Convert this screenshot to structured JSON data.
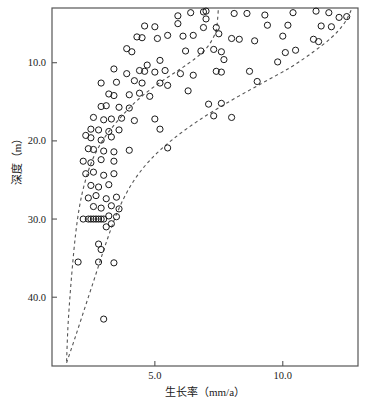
{
  "chart_data": {
    "type": "scatter",
    "title": "",
    "xlabel": "生长率（mm/a）",
    "ylabel": "深度（m）",
    "xlim": [
      0.98,
      12.94
    ],
    "ylim": [
      48.8,
      3.0
    ],
    "y_inverted": true,
    "grid": false,
    "legend": null,
    "xticks": [
      5.0,
      10.0
    ],
    "xtick_labels": [
      "5.0",
      "10.0"
    ],
    "yticks": [
      10.0,
      20.0,
      30.0,
      40.0
    ],
    "ytick_labels": [
      "10.0",
      "20.0",
      "30.0",
      "40.0"
    ],
    "marker": "open-circle",
    "marker_color": "#1a1a1a",
    "marker_radius_px": 3.1,
    "points": [
      [
        5.1,
        6.9
      ],
      [
        5.9,
        4.0
      ],
      [
        6.4,
        3.6
      ],
      [
        6.9,
        3.5
      ],
      [
        7.0,
        4.4
      ],
      [
        7.0,
        3.4
      ],
      [
        8.1,
        3.7
      ],
      [
        8.6,
        3.7
      ],
      [
        9.3,
        3.9
      ],
      [
        10.4,
        3.6
      ],
      [
        11.3,
        3.4
      ],
      [
        11.8,
        3.6
      ],
      [
        12.2,
        4.2
      ],
      [
        12.5,
        4.1
      ],
      [
        4.6,
        5.3
      ],
      [
        5.0,
        5.4
      ],
      [
        5.9,
        5.0
      ],
      [
        6.9,
        5.5
      ],
      [
        7.4,
        5.5
      ],
      [
        9.4,
        5.2
      ],
      [
        10.2,
        5.2
      ],
      [
        11.5,
        5.3
      ],
      [
        11.9,
        5.4
      ],
      [
        4.3,
        6.7
      ],
      [
        4.5,
        6.8
      ],
      [
        5.5,
        6.5
      ],
      [
        6.1,
        6.6
      ],
      [
        6.5,
        6.5
      ],
      [
        7.5,
        6.3
      ],
      [
        8.0,
        6.9
      ],
      [
        8.3,
        7.0
      ],
      [
        8.9,
        7.2
      ],
      [
        10.0,
        6.6
      ],
      [
        11.2,
        7.0
      ],
      [
        11.4,
        7.3
      ],
      [
        3.9,
        8.2
      ],
      [
        4.1,
        8.6
      ],
      [
        6.2,
        8.5
      ],
      [
        6.8,
        8.5
      ],
      [
        7.3,
        8.3
      ],
      [
        7.6,
        8.6
      ],
      [
        10.1,
        8.7
      ],
      [
        10.5,
        8.4
      ],
      [
        4.7,
        10.3
      ],
      [
        5.2,
        9.7
      ],
      [
        7.7,
        9.6
      ],
      [
        9.8,
        9.9
      ],
      [
        3.4,
        10.8
      ],
      [
        3.9,
        11.4
      ],
      [
        4.4,
        11.0
      ],
      [
        4.6,
        11.1
      ],
      [
        5.0,
        11.2
      ],
      [
        5.4,
        11.0
      ],
      [
        6.0,
        11.4
      ],
      [
        6.5,
        11.6
      ],
      [
        7.4,
        11.1
      ],
      [
        7.6,
        11.2
      ],
      [
        8.7,
        11.1
      ],
      [
        2.9,
        12.6
      ],
      [
        3.5,
        12.5
      ],
      [
        4.2,
        12.3
      ],
      [
        4.5,
        12.6
      ],
      [
        5.2,
        12.6
      ],
      [
        5.5,
        12.9
      ],
      [
        9.0,
        12.4
      ],
      [
        3.2,
        14.0
      ],
      [
        3.4,
        14.2
      ],
      [
        4.0,
        14.1
      ],
      [
        4.4,
        13.9
      ],
      [
        4.8,
        14.3
      ],
      [
        6.3,
        13.6
      ],
      [
        2.9,
        15.6
      ],
      [
        3.1,
        15.5
      ],
      [
        3.6,
        15.7
      ],
      [
        4.0,
        15.8
      ],
      [
        7.1,
        15.3
      ],
      [
        7.6,
        15.2
      ],
      [
        2.6,
        17.0
      ],
      [
        3.0,
        17.3
      ],
      [
        3.3,
        17.2
      ],
      [
        3.7,
        17.1
      ],
      [
        4.2,
        17.4
      ],
      [
        5.0,
        17.2
      ],
      [
        7.3,
        16.8
      ],
      [
        8.0,
        17.0
      ],
      [
        2.5,
        18.5
      ],
      [
        2.8,
        18.6
      ],
      [
        3.2,
        18.8
      ],
      [
        3.6,
        18.6
      ],
      [
        5.2,
        18.5
      ],
      [
        2.3,
        19.3
      ],
      [
        2.5,
        19.6
      ],
      [
        2.9,
        19.9
      ],
      [
        3.3,
        19.5
      ],
      [
        2.4,
        21.0
      ],
      [
        2.6,
        21.1
      ],
      [
        3.0,
        21.3
      ],
      [
        3.4,
        21.4
      ],
      [
        4.0,
        21.2
      ],
      [
        5.5,
        20.9
      ],
      [
        2.2,
        22.6
      ],
      [
        2.5,
        22.8
      ],
      [
        2.9,
        22.4
      ],
      [
        3.4,
        22.6
      ],
      [
        2.3,
        24.2
      ],
      [
        2.6,
        24.0
      ],
      [
        3.0,
        24.4
      ],
      [
        3.4,
        24.2
      ],
      [
        2.5,
        25.7
      ],
      [
        2.8,
        25.9
      ],
      [
        3.2,
        25.6
      ],
      [
        2.4,
        27.3
      ],
      [
        2.7,
        27.0
      ],
      [
        3.1,
        27.4
      ],
      [
        3.5,
        27.2
      ],
      [
        2.6,
        28.4
      ],
      [
        2.9,
        28.6
      ],
      [
        3.3,
        28.3
      ],
      [
        3.6,
        28.7
      ],
      [
        2.2,
        30.0
      ],
      [
        2.4,
        30.0
      ],
      [
        2.5,
        30.0
      ],
      [
        2.6,
        30.0
      ],
      [
        2.7,
        30.0
      ],
      [
        2.8,
        30.0
      ],
      [
        2.9,
        30.0
      ],
      [
        3.0,
        30.0
      ],
      [
        3.2,
        29.6
      ],
      [
        3.5,
        29.7
      ],
      [
        3.3,
        30.6
      ],
      [
        3.1,
        31.0
      ],
      [
        2.8,
        33.2
      ],
      [
        2.9,
        33.9
      ],
      [
        2.0,
        35.5
      ],
      [
        2.8,
        35.5
      ],
      [
        3.4,
        35.6
      ],
      [
        3.0,
        42.8
      ]
    ],
    "curves": [
      {
        "name": "lower-envelope-curve",
        "style": "dashed",
        "color": "#555555",
        "points": [
          [
            1.55,
            48.2
          ],
          [
            1.6,
            44.0
          ],
          [
            1.68,
            40.0
          ],
          [
            1.78,
            36.0
          ],
          [
            1.9,
            32.0
          ],
          [
            2.05,
            28.5
          ],
          [
            2.25,
            25.5
          ],
          [
            2.55,
            22.5
          ],
          [
            2.95,
            20.0
          ],
          [
            3.45,
            17.8
          ],
          [
            4.0,
            15.8
          ],
          [
            4.6,
            14.0
          ],
          [
            5.3,
            12.3
          ],
          [
            6.0,
            10.8
          ],
          [
            6.6,
            9.4
          ],
          [
            7.0,
            8.2
          ],
          [
            7.25,
            7.0
          ],
          [
            7.4,
            5.8
          ],
          [
            7.45,
            4.5
          ],
          [
            7.48,
            3.2
          ]
        ]
      },
      {
        "name": "upper-envelope-curve",
        "style": "dashed",
        "color": "#555555",
        "points": [
          [
            1.55,
            48.4
          ],
          [
            1.9,
            45.0
          ],
          [
            2.3,
            41.0
          ],
          [
            2.7,
            37.0
          ],
          [
            3.1,
            33.0
          ],
          [
            3.55,
            29.0
          ],
          [
            4.1,
            25.5
          ],
          [
            4.8,
            22.5
          ],
          [
            5.7,
            19.8
          ],
          [
            6.8,
            17.2
          ],
          [
            8.0,
            14.8
          ],
          [
            9.2,
            12.6
          ],
          [
            10.3,
            10.6
          ],
          [
            11.2,
            8.6
          ],
          [
            11.9,
            6.8
          ],
          [
            12.35,
            5.2
          ],
          [
            12.6,
            3.8
          ],
          [
            12.7,
            3.0
          ]
        ]
      }
    ]
  },
  "axis": {
    "frame_color": "#555555",
    "x_tick_labels": [
      "5.0",
      "10.0"
    ],
    "y_tick_labels": [
      "10.0",
      "20.0",
      "30.0",
      "40.0"
    ],
    "x_title": "生长率（mm/a）",
    "y_title": "深度（m）"
  }
}
